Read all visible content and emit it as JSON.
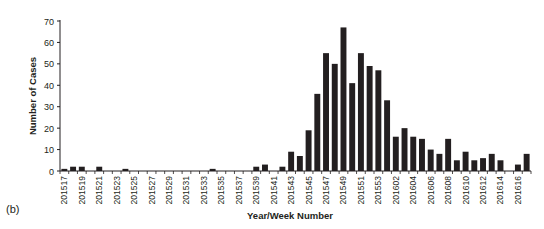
{
  "panel_label": "(b)",
  "chart_data": {
    "type": "bar",
    "title": "",
    "xlabel": "Year/Week Number",
    "ylabel": "Number of Cases",
    "ylim": [
      0,
      70
    ],
    "yticks": [
      0,
      10,
      20,
      30,
      40,
      50,
      60,
      70
    ],
    "grid": false,
    "legend": null,
    "bar_color": "#231f20",
    "categories": [
      "201517",
      "201518",
      "201519",
      "201520",
      "201521",
      "201522",
      "201523",
      "201524",
      "201525",
      "201526",
      "201527",
      "201528",
      "201529",
      "201530",
      "201531",
      "201532",
      "201533",
      "201534",
      "201535",
      "201536",
      "201537",
      "201538",
      "201539",
      "201540",
      "201541",
      "201542",
      "201543",
      "201544",
      "201545",
      "201546",
      "201547",
      "201548",
      "201549",
      "201550",
      "201551",
      "201552",
      "201553",
      "201601",
      "201602",
      "201603",
      "201604",
      "201605",
      "201606",
      "201607",
      "201608",
      "201609",
      "201610",
      "201611",
      "201612",
      "201613",
      "201614",
      "201615",
      "201616",
      "201617"
    ],
    "tick_labels": [
      "201517",
      "201519",
      "201521",
      "201523",
      "201525",
      "201527",
      "201529",
      "201531",
      "201533",
      "201535",
      "201537",
      "201539",
      "201541",
      "201543",
      "201545",
      "201547",
      "201549",
      "201551",
      "201553",
      "201602",
      "201604",
      "201606",
      "201608",
      "201610",
      "201612",
      "201614",
      "201616"
    ],
    "values": [
      1,
      2,
      2,
      0,
      2,
      0,
      0,
      1,
      0,
      0,
      0,
      0,
      0,
      0,
      0,
      0,
      0,
      1,
      0,
      0,
      0,
      0,
      2,
      3,
      0,
      2,
      9,
      7,
      19,
      36,
      55,
      50,
      67,
      41,
      55,
      49,
      47,
      33,
      16,
      20,
      16,
      15,
      10,
      8,
      15,
      5,
      9,
      5,
      6,
      8,
      5,
      0,
      3,
      8
    ]
  }
}
